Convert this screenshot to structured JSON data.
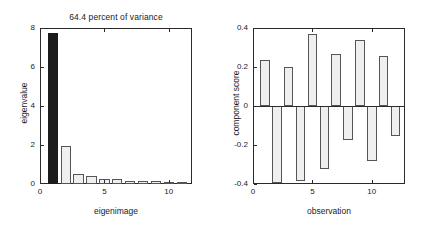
{
  "figure": {
    "background": "#ffffff",
    "axis_color": "#2b2b2b",
    "bar_fill": "#efefef",
    "bar_edge": "#555555",
    "highlight_fill": "#1c1c1c"
  },
  "left": {
    "title": "64.4 percent of variance",
    "xlabel": "eigenimage",
    "ylabel": "eigenvalue",
    "yticks": [
      "0",
      "2",
      "4",
      "6",
      "8"
    ],
    "xticks": [
      "0",
      "5",
      "10"
    ]
  },
  "right": {
    "xlabel": "observation",
    "ylabel": "component score",
    "yticks": [
      "-0.4",
      "-0.2",
      "0",
      "0.2",
      "0.4"
    ],
    "xticks": [
      "0",
      "5",
      "10"
    ]
  },
  "chart_data": [
    {
      "type": "bar",
      "title": "64.4 percent of variance",
      "xlabel": "eigenimage",
      "ylabel": "eigenvalue",
      "categories": [
        1,
        2,
        3,
        4,
        5,
        6,
        7,
        8,
        9,
        10,
        11
      ],
      "values": [
        7.72,
        1.95,
        0.52,
        0.4,
        0.27,
        0.25,
        0.16,
        0.14,
        0.13,
        0.12,
        0.11
      ],
      "highlighted_index": 0,
      "xlim": [
        0,
        11.8
      ],
      "ylim": [
        0,
        8
      ],
      "grid": false,
      "legend": "none"
    },
    {
      "type": "bar",
      "title": "",
      "xlabel": "observation",
      "ylabel": "component score",
      "categories": [
        1,
        2,
        3,
        4,
        5,
        6,
        7,
        8,
        9,
        10,
        11,
        12
      ],
      "values": [
        0.235,
        -0.395,
        0.202,
        -0.383,
        0.367,
        -0.322,
        0.268,
        -0.175,
        0.337,
        -0.283,
        0.257,
        -0.155
      ],
      "xlim": [
        0,
        12.8
      ],
      "ylim": [
        -0.4,
        0.4
      ],
      "grid": false,
      "legend": "none"
    }
  ]
}
